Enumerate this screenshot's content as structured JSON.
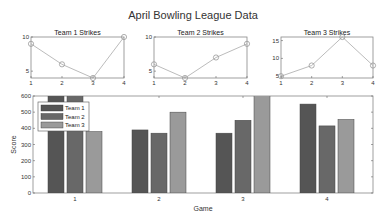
{
  "chart_data": [
    {
      "type": "line",
      "title": "Team 1 Strikes",
      "categories": [
        1,
        2,
        3,
        4
      ],
      "values": [
        9,
        6,
        4,
        10
      ],
      "xlabel": "",
      "ylabel": "",
      "ylim": [
        4,
        10
      ],
      "yticks": [
        5,
        10
      ],
      "xticks": [
        1,
        2,
        3,
        4
      ],
      "marker": "circle",
      "grid": false
    },
    {
      "type": "line",
      "title": "Team 2 Strikes",
      "categories": [
        1,
        2,
        3,
        4
      ],
      "values": [
        6,
        4,
        7,
        9
      ],
      "xlabel": "",
      "ylabel": "",
      "ylim": [
        4,
        10
      ],
      "yticks": [
        5,
        10
      ],
      "xticks": [
        1,
        2,
        3,
        4
      ],
      "marker": "circle",
      "grid": false
    },
    {
      "type": "line",
      "title": "Team 3 Strikes",
      "categories": [
        1,
        2,
        3,
        4
      ],
      "values": [
        5,
        8,
        16,
        8
      ],
      "xlabel": "",
      "ylabel": "",
      "ylim": [
        4.5,
        16
      ],
      "yticks": [
        5,
        10,
        15
      ],
      "xticks": [
        1,
        2,
        3,
        4
      ],
      "marker": "circle",
      "grid": false
    },
    {
      "type": "bar",
      "title": "",
      "categories": [
        "1",
        "2",
        "3",
        "4"
      ],
      "series": [
        {
          "name": "Team 1",
          "values": [
            640,
            390,
            370,
            550
          ],
          "color": "#555555"
        },
        {
          "name": "Team 2",
          "values": [
            640,
            370,
            450,
            415
          ],
          "color": "#686868"
        },
        {
          "name": "Team 3",
          "values": [
            380,
            500,
            640,
            455
          ],
          "color": "#9a9a9a"
        }
      ],
      "xlabel": "Game",
      "ylabel": "Score",
      "ylim": [
        0,
        600
      ],
      "yticks": [
        0,
        100,
        200,
        300,
        400,
        500,
        600
      ],
      "legend_position": "upper-left",
      "grid": false
    }
  ],
  "figure": {
    "title": "April Bowling League Data"
  }
}
